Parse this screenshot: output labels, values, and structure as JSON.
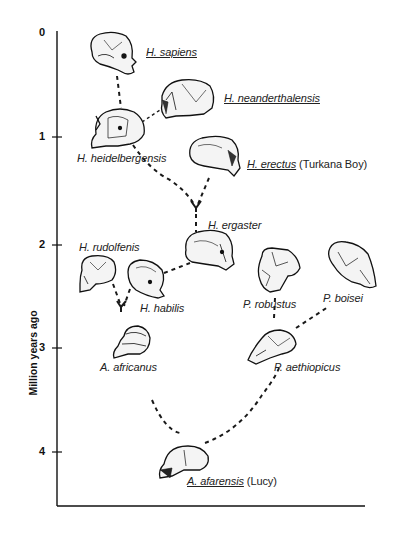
{
  "axis": {
    "label": "Million years ago",
    "ticks": [
      {
        "label": "0",
        "y": 33
      },
      {
        "label": "1",
        "y": 137
      },
      {
        "label": "2",
        "y": 245
      },
      {
        "label": "3",
        "y": 348
      },
      {
        "label": "4",
        "y": 452
      }
    ]
  },
  "species": [
    {
      "key": "sapiens",
      "name": "H. sapiens",
      "suffix": "",
      "underlined": true
    },
    {
      "key": "neanderthalensis",
      "name": "H. neanderthalensis",
      "suffix": "",
      "underlined": true
    },
    {
      "key": "heidelbergensis",
      "name": "H. heidelbergensis",
      "suffix": "",
      "underlined": false
    },
    {
      "key": "erectus",
      "name": "H. erectus",
      "suffix": "(Turkana Boy)",
      "underlined": true
    },
    {
      "key": "ergaster",
      "name": "H. ergaster",
      "suffix": "",
      "underlined": false
    },
    {
      "key": "rudolfenis",
      "name": "H. rudolfenis",
      "suffix": "",
      "underlined": false
    },
    {
      "key": "habilis",
      "name": "H. habilis",
      "suffix": "",
      "underlined": false
    },
    {
      "key": "robustus",
      "name": "P. robustus",
      "suffix": "",
      "underlined": false
    },
    {
      "key": "boisei",
      "name": "P. boisei",
      "suffix": "",
      "underlined": false
    },
    {
      "key": "africanus",
      "name": "A. africanus",
      "suffix": "",
      "underlined": false
    },
    {
      "key": "aethiopicus",
      "name": "P. aethiopicus",
      "suffix": "",
      "underlined": false
    },
    {
      "key": "afarensis",
      "name": "A. afarensis",
      "suffix": "(Lucy)",
      "underlined": true
    }
  ],
  "lineage_links": [
    [
      "afarensis",
      "africanus"
    ],
    [
      "afarensis",
      "aethiopicus"
    ],
    [
      "aethiopicus",
      "robustus"
    ],
    [
      "aethiopicus",
      "boisei"
    ],
    [
      "africanus",
      "rudolfenis"
    ],
    [
      "africanus",
      "habilis"
    ],
    [
      "habilis",
      "ergaster"
    ],
    [
      "ergaster",
      "heidelbergensis"
    ],
    [
      "ergaster",
      "erectus"
    ],
    [
      "heidelbergensis",
      "sapiens"
    ],
    [
      "heidelbergensis",
      "neanderthalensis"
    ]
  ]
}
